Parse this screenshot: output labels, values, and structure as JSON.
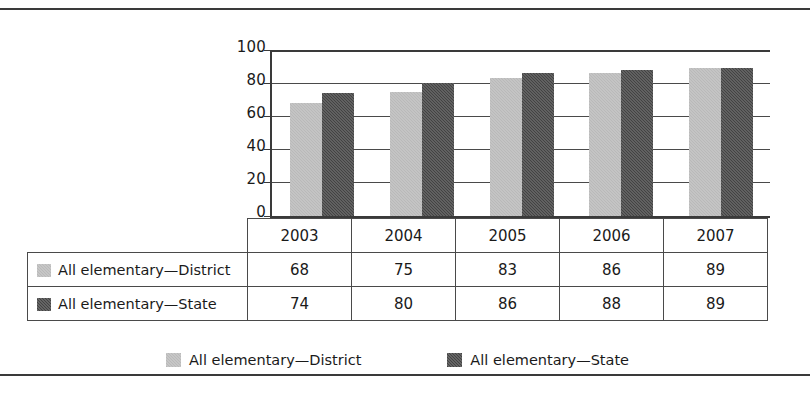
{
  "chart_data": {
    "type": "bar",
    "title": "",
    "subtitle": "",
    "xlabel": "",
    "ylabel": "",
    "categories": [
      "2003",
      "2004",
      "2005",
      "2006",
      "2007"
    ],
    "series": [
      {
        "name": "All elementary—District",
        "values": [
          68,
          75,
          83,
          86,
          89
        ],
        "color": "#b9b9b9"
      },
      {
        "name": "All elementary—State",
        "values": [
          74,
          80,
          86,
          88,
          89
        ],
        "color": "#434343"
      }
    ],
    "ylim": [
      0,
      100
    ],
    "yticks": [
      "0",
      "20",
      "40",
      "60",
      "80",
      "100"
    ],
    "grid": "horizontal",
    "legend_position": "bottom",
    "annotations": []
  },
  "table": {
    "corner_label": "",
    "column_headers": [
      "2003",
      "2004",
      "2005",
      "2006",
      "2007"
    ],
    "rows": [
      {
        "label": "All elementary—District",
        "swatch": "district-swatch",
        "values": [
          "68",
          "75",
          "83",
          "86",
          "89"
        ]
      },
      {
        "label": "All elementary—State",
        "swatch": "state-swatch",
        "values": [
          "74",
          "80",
          "86",
          "88",
          "89"
        ]
      }
    ]
  },
  "legend": {
    "items": [
      {
        "label": "All elementary—District",
        "swatch": "district-swatch"
      },
      {
        "label": "All elementary—State",
        "swatch": "state-swatch"
      }
    ]
  },
  "axis": {
    "y_ticks": [
      "100",
      "80",
      "60",
      "40",
      "20",
      "0"
    ]
  },
  "colors": {
    "district": "#b9b9b9",
    "state": "#434343",
    "rule": "#3a3a3a",
    "grid": "#4a4a4a",
    "text": "#1a1a1a"
  }
}
